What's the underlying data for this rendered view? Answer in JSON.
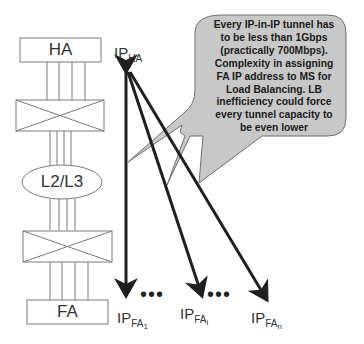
{
  "stack": {
    "ha_label": "HA",
    "l2l3_label": "L2/L3",
    "fa_label": "FA"
  },
  "ip_labels": {
    "ha": {
      "base": "IP",
      "sub": "HA"
    },
    "fa1": {
      "base": "IP",
      "sub": "FA",
      "subsub": "1"
    },
    "fai": {
      "base": "IP",
      "sub": "FA",
      "subsub": "i"
    },
    "fan": {
      "base": "IP",
      "sub": "FA",
      "subsub": "n"
    }
  },
  "ellipsis": "•••",
  "callout": {
    "text": "Every IP-in-IP tunnel has to be less than 1Gbps (practically 700Mbps). Complexity in assigning FA IP address to MS for Load Balancing. LB inefficiency could force every tunnel capacity to be even lower"
  },
  "colors": {
    "line": "#7a7a7a",
    "arrow": "#1f1f1f",
    "callout_fill": "#c8c8c8",
    "callout_stroke": "#6e6e6e"
  }
}
